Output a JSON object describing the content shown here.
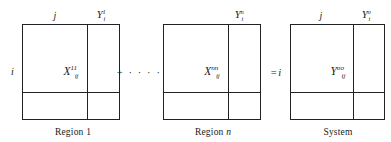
{
  "figure": {
    "type": "interregional-input-output-matrix-diagram",
    "blocks": [
      {
        "id": "region-1",
        "top_label": "j",
        "left_label": "i",
        "center_symbol": "X",
        "center_superscript": "11",
        "center_subscript": "ij",
        "corner_symbol": "Y",
        "corner_superscript": "1",
        "corner_subscript": "i",
        "caption": "Region 1",
        "caption_italic_part": ""
      },
      {
        "id": "region-n",
        "top_label": "",
        "left_label": "",
        "center_symbol": "X",
        "center_superscript": "nn",
        "center_subscript": "ij",
        "corner_symbol": "Y",
        "corner_superscript": "n",
        "corner_subscript": "i",
        "caption": "Region ",
        "caption_italic_part": "n"
      },
      {
        "id": "system",
        "top_label": "j",
        "left_label": "",
        "center_symbol": "Y",
        "center_superscript": "oo",
        "center_subscript": "ij",
        "corner_symbol": "Y",
        "corner_superscript": "o",
        "corner_subscript": "i",
        "caption": "System",
        "caption_italic_part": ""
      }
    ],
    "operators": {
      "sum_connector": "+ · · · · +",
      "equals_connector": "=",
      "equals_index": "i"
    },
    "colors": {
      "stroke": "#222222",
      "background": "#ffffff",
      "text": "#1a1a1a"
    }
  }
}
